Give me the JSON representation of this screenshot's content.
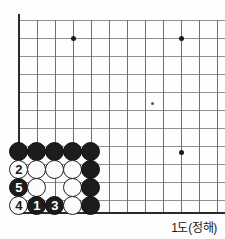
{
  "figure": {
    "kind": "go-board-diagram",
    "caption": "1도(정해)",
    "board": {
      "origin_label": "bottom-left corner",
      "grid_cols": 12,
      "grid_rows": 12,
      "cell_size": 18,
      "left_edge_x": 19,
      "top_clip_y": 20,
      "bottom_edge_y": 212,
      "line_color": "#8e8e8e",
      "border_color": "#2b2b2b"
    },
    "star_points": [
      {
        "name": "star-point-upper-left",
        "x": 73,
        "y": 38,
        "size": "major"
      },
      {
        "name": "star-point-upper-right",
        "x": 181,
        "y": 38,
        "size": "major"
      },
      {
        "name": "star-point-center",
        "x": 152,
        "y": 103,
        "size": "minor"
      },
      {
        "name": "star-point-lower-right",
        "x": 181,
        "y": 152,
        "size": "major"
      }
    ],
    "grid_h_lines_y": [
      20,
      38,
      56,
      74,
      92,
      110,
      128,
      146,
      164,
      182,
      200
    ],
    "grid_v_lines_x": [
      37,
      55,
      73,
      91,
      109,
      127,
      145,
      163,
      181,
      199,
      217
    ],
    "stones": [
      {
        "name": "stone-black-a5",
        "color": "black",
        "label": "",
        "x": 19,
        "y": 152
      },
      {
        "name": "stone-black-b5",
        "color": "black",
        "label": "",
        "x": 37,
        "y": 152
      },
      {
        "name": "stone-black-c5",
        "color": "black",
        "label": "",
        "x": 55,
        "y": 152
      },
      {
        "name": "stone-black-d5",
        "color": "black",
        "label": "",
        "x": 73,
        "y": 152
      },
      {
        "name": "stone-black-e5",
        "color": "black",
        "label": "",
        "x": 91,
        "y": 152
      },
      {
        "name": "stone-white-move-2",
        "color": "white",
        "label": "2",
        "x": 19,
        "y": 170
      },
      {
        "name": "stone-white-b4",
        "color": "white",
        "label": "",
        "x": 37,
        "y": 170
      },
      {
        "name": "stone-white-c4",
        "color": "white",
        "label": "",
        "x": 55,
        "y": 170
      },
      {
        "name": "stone-white-d4",
        "color": "white",
        "label": "",
        "x": 73,
        "y": 170
      },
      {
        "name": "stone-black-e4",
        "color": "black",
        "label": "",
        "x": 91,
        "y": 170
      },
      {
        "name": "stone-black-move-5",
        "color": "black",
        "label": "5",
        "x": 19,
        "y": 188
      },
      {
        "name": "stone-white-b3",
        "color": "white",
        "label": "",
        "x": 37,
        "y": 188
      },
      {
        "name": "stone-white-d3",
        "color": "white",
        "label": "",
        "x": 73,
        "y": 188
      },
      {
        "name": "stone-black-e3",
        "color": "black",
        "label": "",
        "x": 91,
        "y": 188
      },
      {
        "name": "stone-white-move-4",
        "color": "white",
        "label": "4",
        "x": 19,
        "y": 206
      },
      {
        "name": "stone-black-move-1",
        "color": "black",
        "label": "1",
        "x": 37,
        "y": 206
      },
      {
        "name": "stone-black-move-3",
        "color": "black",
        "label": "3",
        "x": 55,
        "y": 206
      },
      {
        "name": "stone-white-d2",
        "color": "white",
        "label": "",
        "x": 73,
        "y": 206
      },
      {
        "name": "stone-black-e2",
        "color": "black",
        "label": "",
        "x": 91,
        "y": 206
      }
    ],
    "move_sequence": [
      {
        "number": "1",
        "color": "black"
      },
      {
        "number": "2",
        "color": "white"
      },
      {
        "number": "3",
        "color": "black"
      },
      {
        "number": "4",
        "color": "white"
      },
      {
        "number": "5",
        "color": "black"
      }
    ]
  }
}
